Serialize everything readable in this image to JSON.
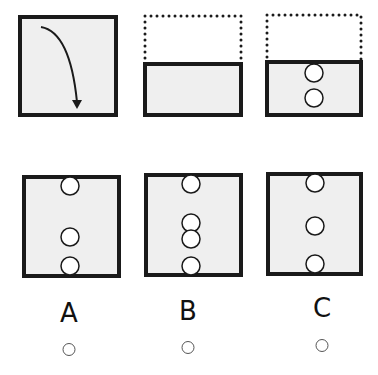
{
  "question": {
    "fold_square": {
      "box": [
        20,
        17,
        96,
        98
      ],
      "arrow": "fold-down"
    },
    "fold_step": {
      "dotted": [
        145,
        16,
        96,
        48
      ],
      "solid": [
        145,
        64,
        96,
        51
      ]
    },
    "punch_step": {
      "dotted": [
        267,
        15,
        94,
        47
      ],
      "solid": [
        267,
        62,
        94,
        53
      ],
      "holes_y": [
        73,
        98
      ],
      "hole_x": 314
    }
  },
  "options": [
    {
      "label": "A",
      "box": [
        24,
        177,
        95,
        99
      ],
      "hole_x": 70,
      "holes_y": [
        186,
        237,
        266
      ],
      "label_x": 69,
      "label_y": 298,
      "radio_x": 69,
      "radio_y": 343
    },
    {
      "label": "B",
      "box": [
        146,
        175,
        95,
        100
      ],
      "hole_x": 191,
      "holes_y": [
        184,
        223,
        239,
        266
      ],
      "label_x": 188,
      "label_y": 296,
      "radio_x": 188,
      "radio_y": 341
    },
    {
      "label": "C",
      "box": [
        268,
        174,
        93,
        100
      ],
      "hole_x": 315,
      "holes_y": [
        183,
        226,
        264
      ],
      "label_x": 322,
      "label_y": 293,
      "radio_x": 322,
      "radio_y": 339
    }
  ],
  "colors": {
    "fill": "#efefef",
    "stroke": "#1a1a1a"
  }
}
